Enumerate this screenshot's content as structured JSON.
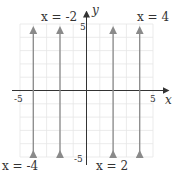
{
  "diagram": {
    "type": "coordinate-plane",
    "x_axis_label": "x",
    "y_axis_label": "y",
    "x_range": [
      -5,
      5
    ],
    "y_range": [
      -5,
      5
    ],
    "tick_labels": {
      "x_min": "-5",
      "x_max": "5",
      "y_min": "-5",
      "y_max": "5"
    },
    "vertical_lines": [
      {
        "x": -4,
        "label": "x = -4"
      },
      {
        "x": -2,
        "label": "x = -2"
      },
      {
        "x": 2,
        "label": "x = 2"
      },
      {
        "x": 4,
        "label": "x = 4"
      }
    ],
    "colors": {
      "grid": "#e6e6e6",
      "axis": "#333333",
      "line": "#8a8a8a"
    }
  }
}
